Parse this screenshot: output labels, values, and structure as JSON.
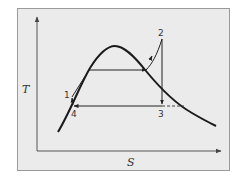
{
  "diagram": {
    "axes": {
      "y_label": "T",
      "x_label": "S"
    },
    "points": [
      {
        "id": "1",
        "label": "1"
      },
      {
        "id": "2",
        "label": "2"
      },
      {
        "id": "3",
        "label": "3"
      },
      {
        "id": "4",
        "label": "4"
      }
    ],
    "colors": {
      "background": "#ebebeb",
      "border": "#9a9a9a",
      "stroke": "#1a1a1a"
    }
  }
}
